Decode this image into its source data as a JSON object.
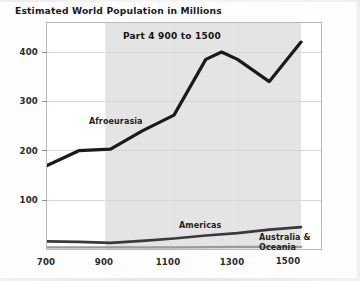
{
  "title": "Estimated World Population in Millions",
  "band_title": "Part 4 900 to 1500",
  "axis": {
    "y_ticks": [
      "100",
      "200",
      "300",
      "400"
    ],
    "x_ticks": [
      "700",
      "900",
      "1100",
      "1300",
      "1500"
    ]
  },
  "series_labels": {
    "afroeurasia": "Afroeurasia",
    "americas": "Americas",
    "australia": "Australia & Oceania"
  },
  "colors": {
    "line": "#1a1a1a",
    "band": "#e4e4e4",
    "grid": "#d6d6d6",
    "frame": "#b9b9b9",
    "background": "#ffffff"
  },
  "chart_data": {
    "type": "line",
    "title": "Estimated World Population in Millions",
    "subtitle": "Part 4 900 to 1500",
    "xlabel": "",
    "ylabel": "",
    "xlim": [
      700,
      1560
    ],
    "ylim": [
      0,
      455
    ],
    "grid": true,
    "legend": "inline-annotations",
    "highlight_band": {
      "from": 900,
      "to": 1500,
      "label": "Part 4 900 to 1500"
    },
    "x": [
      700,
      800,
      900,
      1000,
      1100,
      1200,
      1250,
      1300,
      1400,
      1500
    ],
    "series": [
      {
        "name": "Afroeurasia",
        "x": [
          700,
          800,
          900,
          1000,
          1100,
          1200,
          1250,
          1300,
          1400,
          1500
        ],
        "values": [
          170,
          200,
          203,
          240,
          272,
          385,
          400,
          385,
          340,
          420
        ]
      },
      {
        "name": "Americas",
        "x": [
          700,
          800,
          900,
          1000,
          1100,
          1200,
          1300,
          1400,
          1500
        ],
        "values": [
          16,
          15,
          13,
          17,
          22,
          28,
          33,
          40,
          45
        ]
      },
      {
        "name": "Australia & Oceania",
        "x": [
          700,
          900,
          1100,
          1300,
          1500
        ],
        "values": [
          4,
          4,
          4,
          5,
          5
        ]
      }
    ]
  }
}
